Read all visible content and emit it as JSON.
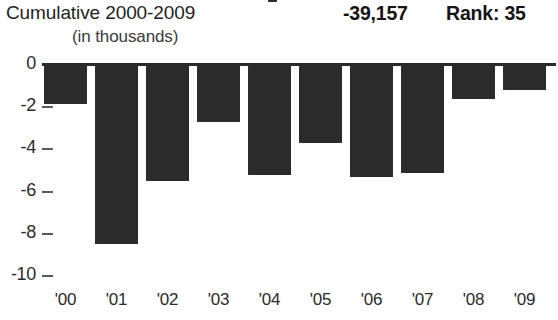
{
  "header": {
    "title": "Cumulative 2000-2009",
    "total": "-39,157",
    "rank": "Rank: 35",
    "subtitle": "(in thousands)"
  },
  "colors": {
    "bar": "#2b2b2b",
    "axis": "#2b2b2b",
    "text": "#231f20",
    "background": "#ffffff"
  },
  "chart_data": {
    "type": "bar",
    "title": "Cumulative 2000-2009",
    "subtitle": "(in thousands)",
    "xlabel": "",
    "ylabel": "",
    "ylim": [
      -10,
      0
    ],
    "yticks": [
      0,
      -2,
      -4,
      -6,
      -8,
      -10
    ],
    "ytick_labels": [
      "0",
      "-2",
      "-4",
      "-6",
      "-8",
      "-10"
    ],
    "grid": false,
    "legend": null,
    "categories": [
      "'00",
      "'01",
      "'02",
      "'03",
      "'04",
      "'05",
      "'06",
      "'07",
      "'08",
      "'09"
    ],
    "values": [
      -1.85,
      -8.5,
      -5.5,
      -2.7,
      -5.2,
      -3.7,
      -5.3,
      -5.1,
      -1.6,
      -1.2
    ],
    "annotations": {
      "cumulative_total": "-39,157",
      "rank": "Rank: 35",
      "units": "thousands"
    }
  }
}
